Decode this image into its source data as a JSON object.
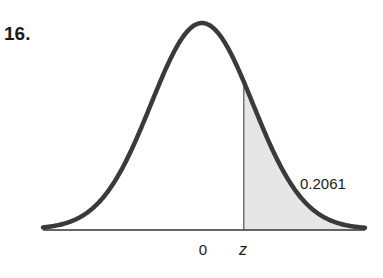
{
  "problem": {
    "number": "16."
  },
  "chart_data": {
    "type": "area",
    "title": "",
    "xlabel": "",
    "ylabel": "",
    "tick_labels": [
      "0",
      "z"
    ],
    "annotations": [
      {
        "text": "0.2061",
        "target": "shaded right-tail area"
      }
    ],
    "shaded_region": {
      "from": "z",
      "to": "+inf",
      "area": 0.2061
    },
    "z_value_implied": 0.82,
    "mean": 0,
    "grid": false,
    "legend": null
  },
  "labels": {
    "mean": "0",
    "z": "z",
    "area": "0.2061"
  },
  "colors": {
    "curve": "#3a3a3a",
    "shade": "#e6e6e6",
    "axis": "#333333",
    "text": "#1a1a1a"
  }
}
